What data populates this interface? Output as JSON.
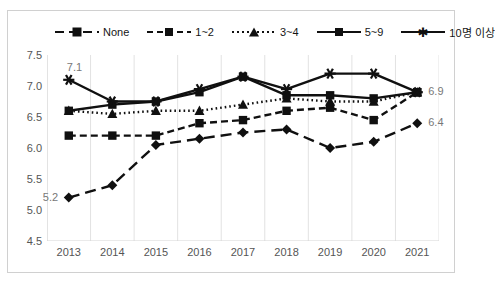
{
  "chart_data": {
    "type": "line",
    "title": "",
    "xlabel": "",
    "ylabel": "",
    "categories": [
      "2013",
      "2014",
      "2015",
      "2016",
      "2017",
      "2018",
      "2019",
      "2020",
      "2021"
    ],
    "ylim": [
      4.5,
      7.5
    ],
    "ytick_labels": [
      "7.5",
      "7.0",
      "6.5",
      "6.0",
      "5.5",
      "5.0",
      "4.5"
    ],
    "ytick_values": [
      7.5,
      7.0,
      6.5,
      6.0,
      5.5,
      5.0,
      4.5
    ],
    "grid": "vertical",
    "legend_position": "top",
    "series": [
      {
        "name": "None",
        "marker": "diamond",
        "line_style": "long-dash",
        "color": "#101010",
        "values": [
          5.2,
          5.4,
          6.05,
          6.15,
          6.25,
          6.3,
          6.0,
          6.1,
          6.4
        ]
      },
      {
        "name": "1~2",
        "marker": "square",
        "line_style": "dash",
        "color": "#101010",
        "values": [
          6.2,
          6.2,
          6.2,
          6.4,
          6.45,
          6.6,
          6.65,
          6.45,
          6.9
        ]
      },
      {
        "name": "3~4",
        "marker": "triangle",
        "line_style": "dot",
        "color": "#101010",
        "values": [
          6.6,
          6.55,
          6.6,
          6.6,
          6.7,
          6.8,
          6.75,
          6.75,
          6.9
        ]
      },
      {
        "name": "5~9",
        "marker": "square",
        "line_style": "solid",
        "color": "#101010",
        "values": [
          6.6,
          6.7,
          6.75,
          6.9,
          7.15,
          6.85,
          6.85,
          6.8,
          6.9
        ]
      },
      {
        "name": "10명 이상",
        "marker": "star",
        "line_style": "solid",
        "color": "#101010",
        "values": [
          7.1,
          6.75,
          6.75,
          6.95,
          7.15,
          6.95,
          7.2,
          7.2,
          6.9
        ]
      }
    ],
    "annotations": [
      {
        "text": "7.1",
        "series": "10명 이상",
        "category": "2013",
        "value": 7.1,
        "position": "above-left"
      },
      {
        "text": "5.2",
        "series": "None",
        "category": "2013",
        "value": 5.2,
        "position": "left"
      },
      {
        "text": "6.9",
        "series": "10명 이상",
        "category": "2021",
        "value": 6.9,
        "position": "right"
      },
      {
        "text": "6.4",
        "series": "None",
        "category": "2021",
        "value": 6.4,
        "position": "right"
      }
    ]
  },
  "legend": {
    "items": [
      {
        "label": "None",
        "marker": "diamond-marker",
        "line": "long-dash"
      },
      {
        "label": "1~2",
        "marker": "square-marker",
        "line": "dash"
      },
      {
        "label": "3~4",
        "marker": "triangle-marker",
        "line": "dot"
      },
      {
        "label": "5~9",
        "marker": "square-marker",
        "line": "solid"
      },
      {
        "label": "10명 이상",
        "marker": "star-marker",
        "line": "solid"
      }
    ]
  },
  "axes": {
    "y_labels": [
      "7.5",
      "7.0",
      "6.5",
      "6.0",
      "5.5",
      "5.0",
      "4.5"
    ],
    "x_labels": [
      "2013",
      "2014",
      "2015",
      "2016",
      "2017",
      "2018",
      "2019",
      "2020",
      "2021"
    ]
  }
}
